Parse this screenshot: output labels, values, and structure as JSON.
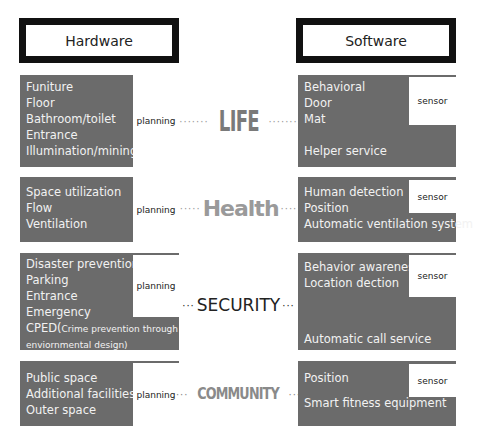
{
  "headers": {
    "left": "Hardware",
    "right": "Software"
  },
  "rows": [
    {
      "category": "LIFE",
      "left_dots": "·······",
      "right_dots": "·······",
      "hardware": {
        "items": [
          "Funiture",
          "Floor",
          "Bathroom/toilet",
          "Entrance",
          "Illumination/mining"
        ],
        "tag": "planning"
      },
      "software": {
        "items": [
          "Behavioral",
          "Door",
          "Mat",
          "",
          "Helper service"
        ],
        "tag": "sensor"
      }
    },
    {
      "category": "Health",
      "left_dots": "·····",
      "right_dots": "····",
      "hardware": {
        "items": [
          "Space utilization",
          "Flow",
          "Ventilation"
        ],
        "tag": "planning"
      },
      "software": {
        "items": [
          "Human detection",
          "Position",
          "Automatic ventilation system"
        ],
        "tag": "sensor"
      }
    },
    {
      "category": "SECURITY",
      "left_dots": "···",
      "right_dots": "···",
      "hardware": {
        "items": [
          "Disaster prevention",
          "Parking",
          "Entrance",
          "Emergency"
        ],
        "extra_main": "CPED(",
        "extra_small": "Crime prevention through",
        "extra_line2": "enviornmental design)",
        "tag": "planning"
      },
      "software": {
        "items": [
          "Behavior awareness",
          "Location dection",
          "",
          "",
          "Automatic call service"
        ],
        "tag": "sensor"
      }
    },
    {
      "category": "COMMUNITY",
      "left_dots": "···",
      "right_dots": "···",
      "hardware": {
        "items": [
          "Public space",
          "Additional facilities",
          "Outer space"
        ],
        "tag": "planning"
      },
      "software": {
        "items": [
          "Position",
          "",
          "Smart fitness equipment"
        ],
        "tag": "sensor"
      }
    }
  ]
}
